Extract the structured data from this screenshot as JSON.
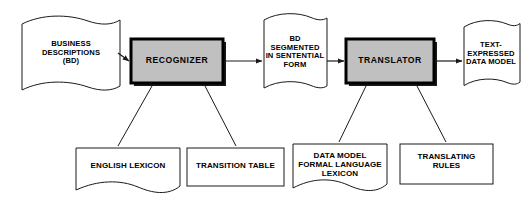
{
  "figure": {
    "background_color": "#ffffff",
    "line_color": "#1a1a1a",
    "process_fill_color": "#c0c0c0",
    "process_border_color": "#000000",
    "store_fill_color": "#ffffff"
  },
  "nodes": {
    "business_descriptions": {
      "label": "BUSINESS\nDESCRIPTIONS\n(BD)",
      "shape": "wavy-banner"
    },
    "recognizer": {
      "label": "RECOGNIZER",
      "shape": "shadowed-rectangle"
    },
    "bd_segmented": {
      "label": "BD\nSEGMENTED\nIN SENTENTIAL\nFORM",
      "shape": "wavy-banner"
    },
    "translator": {
      "label": "TRANSLATOR",
      "shape": "shadowed-rectangle"
    },
    "text_expressed_data_model": {
      "label": "TEXT-\nEXPRESSED\nDATA MODEL",
      "shape": "wavy-banner"
    },
    "english_lexicon": {
      "label": "ENGLISH LEXICON",
      "shape": "wavy-bottom-rectangle"
    },
    "transition_table": {
      "label": "TRANSITION TABLE",
      "shape": "rectangle"
    },
    "data_model_formal_language_lexicon": {
      "label": "DATA MODEL\nFORMAL LANGUAGE\nLEXICON",
      "shape": "wavy-bottom-rectangle"
    },
    "translating_rules": {
      "label": "TRANSLATING\nRULES",
      "shape": "rectangle"
    }
  },
  "connections": [
    {
      "name": "bd-to-recognizer",
      "from": "business_descriptions",
      "to": "recognizer",
      "style": "arrow"
    },
    {
      "name": "recognizer-to-bd-segmented",
      "from": "recognizer",
      "to": "bd_segmented",
      "style": "arrow"
    },
    {
      "name": "bd-segmented-to-translator",
      "from": "bd_segmented",
      "to": "translator",
      "style": "arrow"
    },
    {
      "name": "translator-to-text-expressed-data-model",
      "from": "translator",
      "to": "text_expressed_data_model",
      "style": "arrow"
    },
    {
      "name": "recognizer-to-english-lexicon",
      "from": "recognizer",
      "to": "english_lexicon",
      "style": "line"
    },
    {
      "name": "recognizer-to-transition-table",
      "from": "recognizer",
      "to": "transition_table",
      "style": "line"
    },
    {
      "name": "translator-to-data-model-lexicon",
      "from": "translator",
      "to": "data_model_formal_language_lexicon",
      "style": "line"
    },
    {
      "name": "translator-to-translating-rules",
      "from": "translator",
      "to": "translating_rules",
      "style": "line"
    }
  ]
}
